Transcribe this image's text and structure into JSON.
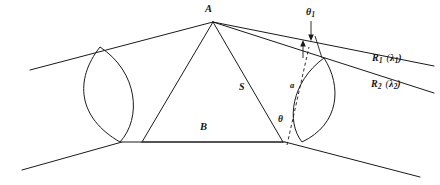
{
  "figure": {
    "background_color": "#ffffff",
    "line_color": "#1a1a1a",
    "width": 440,
    "height": 185
  },
  "labels": {
    "apex_vertex": "A",
    "baseline": "B",
    "side_length": "S",
    "dashed_segment": "a",
    "angle_theta": "θ",
    "angle_theta1_base": "θ",
    "angle_theta1_sub": "1",
    "ray1_base": "R",
    "ray1_sub": "1",
    "ray1_wavelength_open": "(",
    "ray1_wavelength_symbol": "λ",
    "ray1_wavelength_sub": "1",
    "ray1_wavelength_close": ")",
    "ray2_base": "R",
    "ray2_sub": "2",
    "ray2_wavelength_open": "(",
    "ray2_wavelength_symbol": "λ",
    "ray2_wavelength_sub": "2",
    "ray2_wavelength_close": ")"
  },
  "elements": {
    "apex_label_name": "apex-point-A",
    "baseline_label_name": "baseline-B",
    "side_label_name": "side-S",
    "dashed_label_name": "path-difference-a",
    "theta_label_name": "angle-theta",
    "theta1_label_name": "angle-theta-one",
    "ray1_label_name": "ray-R1-lambda1",
    "ray2_label_name": "ray-R2-lambda2",
    "left_lens_name": "left-aperture-lens",
    "right_lens_name": "right-aperture-lens",
    "triangle_name": "baseline-triangle",
    "upper_boundary_name": "upper-boundary-line",
    "lower_boundary_name": "lower-boundary-line"
  }
}
